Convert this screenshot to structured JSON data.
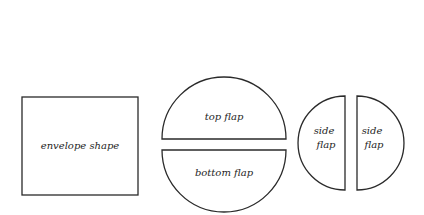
{
  "diagram": {
    "envelope": {
      "label": "envelope shape"
    },
    "top_flap": {
      "label": "top flap"
    },
    "bottom_flap": {
      "label": "bottom flap"
    },
    "side_flap_left": {
      "label_line1": "side",
      "label_line2": "flap"
    },
    "side_flap_right": {
      "label_line1": "side",
      "label_line2": "flap"
    }
  },
  "colors": {
    "stroke": "#2a2a2a",
    "text": "#1e1e1e",
    "background": "#ffffff"
  }
}
